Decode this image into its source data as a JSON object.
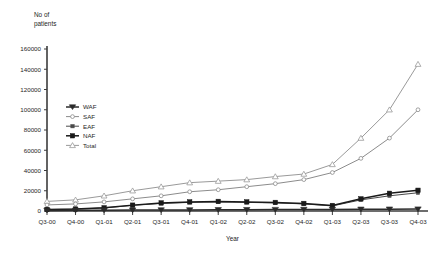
{
  "chart_data": {
    "type": "line",
    "title": "",
    "xlabel": "Year",
    "ylabel_line1": "No of",
    "ylabel_line2": "patients",
    "ylim": [
      0,
      160000
    ],
    "ytick_labels": [
      "0",
      "20000",
      "40000",
      "60000",
      "80000",
      "100000",
      "120000",
      "140000",
      "160000"
    ],
    "ytick_values": [
      0,
      20000,
      40000,
      60000,
      80000,
      100000,
      120000,
      140000,
      160000
    ],
    "grid": false,
    "legend_position": "inside-left",
    "categories": [
      "Q3-00",
      "Q4-00",
      "Q1-01",
      "Q2-01",
      "Q3-01",
      "Q4-01",
      "Q1-02",
      "Q2-02",
      "Q3-02",
      "Q4-02",
      "Q1-03",
      "Q2-03",
      "Q3-03",
      "Q4-03"
    ],
    "series": [
      {
        "name": "WAF",
        "marker": "triangle-down-filled",
        "color": "#2b2b2b",
        "values": [
          600,
          700,
          800,
          900,
          1000,
          1100,
          1200,
          1300,
          1400,
          1500,
          1600,
          1700,
          1800,
          1900
        ]
      },
      {
        "name": "SAF",
        "marker": "circle-open",
        "color": "#8c8c8c",
        "values": [
          6000,
          7000,
          9000,
          12000,
          15000,
          19000,
          21000,
          24000,
          27000,
          31000,
          38000,
          52000,
          72000,
          100000
        ]
      },
      {
        "name": "EAF",
        "marker": "square-small-filled",
        "color": "#4a4a4a",
        "values": [
          1200,
          1800,
          3000,
          5500,
          7500,
          8500,
          9000,
          8500,
          8000,
          7000,
          5000,
          11000,
          15000,
          18000
        ]
      },
      {
        "name": "NAF",
        "marker": "square-filled",
        "color": "#1a1a1a",
        "values": [
          1500,
          2000,
          3200,
          5800,
          8000,
          9000,
          9500,
          9000,
          8500,
          7500,
          5500,
          12000,
          17500,
          20500
        ]
      },
      {
        "name": "Total",
        "marker": "triangle-up-open",
        "color": "#9a9a9a",
        "values": [
          9500,
          11000,
          15000,
          20000,
          24000,
          28000,
          29500,
          31000,
          34000,
          36500,
          46000,
          72000,
          100000,
          145000
        ]
      }
    ]
  },
  "legend": {
    "items": [
      {
        "label": "WAF"
      },
      {
        "label": "SAF"
      },
      {
        "label": "EAF"
      },
      {
        "label": "NAF"
      },
      {
        "label": "Total"
      }
    ]
  }
}
